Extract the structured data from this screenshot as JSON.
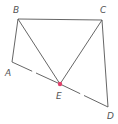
{
  "diagram": {
    "type": "geometry",
    "colors": {
      "line": "#555555",
      "point_E": "#e0406a",
      "label": "#555555"
    },
    "points": {
      "A": {
        "label": "A",
        "x": 12,
        "y": 62,
        "lx": 5,
        "ly": 76
      },
      "B": {
        "label": "B",
        "x": 18,
        "y": 19,
        "lx": 13,
        "ly": 13
      },
      "C": {
        "label": "C",
        "x": 102,
        "y": 20,
        "lx": 100,
        "ly": 13
      },
      "D": {
        "label": "D",
        "x": 108,
        "y": 107,
        "lx": 107,
        "ly": 119
      },
      "E": {
        "label": "E",
        "x": 60,
        "y": 84,
        "lx": 56,
        "ly": 99
      }
    },
    "segments": [
      {
        "from": "A",
        "to": "B",
        "style": "solid"
      },
      {
        "from": "B",
        "to": "C",
        "style": "solid"
      },
      {
        "from": "C",
        "to": "D",
        "style": "solid"
      },
      {
        "from": "B",
        "to": "E",
        "style": "solid"
      },
      {
        "from": "C",
        "to": "E",
        "style": "solid"
      },
      {
        "from": "A",
        "to": "D",
        "style": "broken",
        "through": "E"
      }
    ]
  }
}
